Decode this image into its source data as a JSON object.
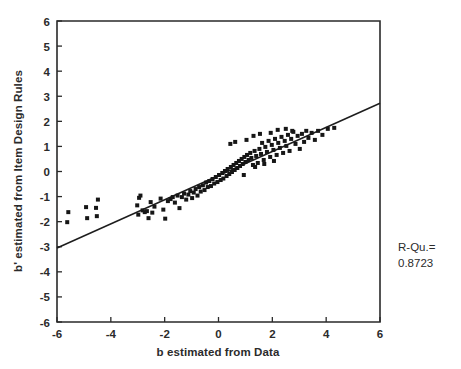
{
  "figure": {
    "background": "#ffffff",
    "ink_color": "#1d1d1d"
  },
  "axes": {
    "x_label": "b estimated from Data",
    "y_label": "b' estimated from Item Design Rules",
    "x_ticks": [
      "-6",
      "-4",
      "-2",
      "0",
      "2",
      "4",
      "6"
    ],
    "y_ticks": [
      "6",
      "5",
      "4",
      "3",
      "2",
      "1",
      "0",
      "-1",
      "-2",
      "-3",
      "-4",
      "-5",
      "-6"
    ]
  },
  "annotations": {
    "r_squared_label": "R-Qu.=",
    "r_squared_value": "0.8723"
  },
  "chart_data": {
    "type": "scatter",
    "title": "",
    "xlabel": "b estimated from Data",
    "ylabel": "b' estimated from Item Design Rules",
    "xlim": [
      -6,
      6
    ],
    "ylim": [
      -6,
      6
    ],
    "xticks": [
      -6,
      -4,
      -2,
      0,
      2,
      4,
      6
    ],
    "yticks": [
      -6,
      -5,
      -4,
      -3,
      -2,
      -1,
      0,
      1,
      2,
      3,
      4,
      5,
      6
    ],
    "grid": false,
    "legend": null,
    "marker": "square",
    "marker_size": 4,
    "annotations": [
      {
        "text": "R-Qu.=",
        "x": 6.9,
        "y": -2.6
      },
      {
        "text": "0.8723",
        "x": 6.9,
        "y": -3.2
      }
    ],
    "fit_line": {
      "type": "linear",
      "x": [
        -6,
        6
      ],
      "y": [
        -3.05,
        2.72
      ],
      "slope": 0.481,
      "intercept": -0.165
    },
    "r_squared": 0.8723,
    "points": [
      [
        -5.62,
        -2.02
      ],
      [
        -5.58,
        -1.62
      ],
      [
        -4.92,
        -1.42
      ],
      [
        -4.88,
        -1.86
      ],
      [
        -4.55,
        -1.45
      ],
      [
        -4.52,
        -1.78
      ],
      [
        -4.48,
        -1.12
      ],
      [
        -3.02,
        -1.35
      ],
      [
        -2.98,
        -1.72
      ],
      [
        -2.95,
        -1.05
      ],
      [
        -2.82,
        -1.55
      ],
      [
        -2.74,
        -1.62
      ],
      [
        -2.66,
        -1.58
      ],
      [
        -2.52,
        -1.22
      ],
      [
        -2.46,
        -1.64
      ],
      [
        -2.38,
        -1.4
      ],
      [
        -2.15,
        -1.08
      ],
      [
        -2.05,
        -1.52
      ],
      [
        -1.98,
        -1.88
      ],
      [
        -1.88,
        -1.18
      ],
      [
        -1.78,
        -1.1
      ],
      [
        -1.7,
        -1.02
      ],
      [
        -1.62,
        -1.24
      ],
      [
        -1.52,
        -0.96
      ],
      [
        -1.45,
        -1.46
      ],
      [
        -1.36,
        -1.02
      ],
      [
        -1.28,
        -0.88
      ],
      [
        -1.2,
        -1.12
      ],
      [
        -1.12,
        -0.92
      ],
      [
        -1.05,
        -0.78
      ],
      [
        -0.98,
        -1.06
      ],
      [
        -0.92,
        -0.84
      ],
      [
        -0.85,
        -0.7
      ],
      [
        -0.78,
        -0.96
      ],
      [
        -0.72,
        -0.62
      ],
      [
        -0.66,
        -0.8
      ],
      [
        -0.58,
        -0.55
      ],
      [
        -0.52,
        -0.74
      ],
      [
        -0.46,
        -0.44
      ],
      [
        -0.4,
        -0.62
      ],
      [
        -0.34,
        -0.38
      ],
      [
        -0.28,
        -0.58
      ],
      [
        -0.22,
        -0.3
      ],
      [
        -0.16,
        -0.48
      ],
      [
        -0.1,
        -0.22
      ],
      [
        -0.04,
        -0.42
      ],
      [
        0.02,
        -0.14
      ],
      [
        0.08,
        -0.34
      ],
      [
        0.14,
        -0.06
      ],
      [
        0.18,
        -0.28
      ],
      [
        0.24,
        0.02
      ],
      [
        0.3,
        -0.18
      ],
      [
        0.34,
        0.1
      ],
      [
        0.4,
        -0.1
      ],
      [
        0.46,
        0.18
      ],
      [
        0.5,
        -0.02
      ],
      [
        0.56,
        0.26
      ],
      [
        0.6,
        0.06
      ],
      [
        0.66,
        0.34
      ],
      [
        0.7,
        0.14
      ],
      [
        0.76,
        0.42
      ],
      [
        0.8,
        0.22
      ],
      [
        0.86,
        0.5
      ],
      [
        0.9,
        0.3
      ],
      [
        0.96,
        0.58
      ],
      [
        1.0,
        0.38
      ],
      [
        1.06,
        0.66
      ],
      [
        1.12,
        0.46
      ],
      [
        1.18,
        0.74
      ],
      [
        1.22,
        0.54
      ],
      [
        1.28,
        0.26
      ],
      [
        1.34,
        0.82
      ],
      [
        1.4,
        0.62
      ],
      [
        1.46,
        0.34
      ],
      [
        1.52,
        0.9
      ],
      [
        1.58,
        0.7
      ],
      [
        1.62,
        1.14
      ],
      [
        1.68,
        0.46
      ],
      [
        1.74,
        0.98
      ],
      [
        1.8,
        0.78
      ],
      [
        1.86,
        1.22
      ],
      [
        1.92,
        0.58
      ],
      [
        1.98,
        1.06
      ],
      [
        2.04,
        0.86
      ],
      [
        2.1,
        1.3
      ],
      [
        2.16,
        0.66
      ],
      [
        2.22,
        1.14
      ],
      [
        2.28,
        0.94
      ],
      [
        2.34,
        1.38
      ],
      [
        2.4,
        0.74
      ],
      [
        2.46,
        1.22
      ],
      [
        2.52,
        1.02
      ],
      [
        2.58,
        1.46
      ],
      [
        2.64,
        0.82
      ],
      [
        2.7,
        1.3
      ],
      [
        2.78,
        1.58
      ],
      [
        2.86,
        1.1
      ],
      [
        2.94,
        1.42
      ],
      [
        3.02,
        0.9
      ],
      [
        3.1,
        1.5
      ],
      [
        3.18,
        1.18
      ],
      [
        3.26,
        1.62
      ],
      [
        3.34,
        1.34
      ],
      [
        3.46,
        1.54
      ],
      [
        3.58,
        1.26
      ],
      [
        3.7,
        1.62
      ],
      [
        3.86,
        1.46
      ],
      [
        4.06,
        1.7
      ],
      [
        4.3,
        1.74
      ],
      [
        0.44,
        1.1
      ],
      [
        0.62,
        1.18
      ],
      [
        1.04,
        1.26
      ],
      [
        1.3,
        1.42
      ],
      [
        1.54,
        1.5
      ],
      [
        1.94,
        1.54
      ],
      [
        2.2,
        1.66
      ],
      [
        2.5,
        1.7
      ],
      [
        2.74,
        1.62
      ],
      [
        -2.9,
        -0.96
      ],
      [
        -2.6,
        -1.86
      ],
      [
        0.94,
        -0.14
      ],
      [
        1.36,
        0.18
      ],
      [
        1.7,
        0.3
      ],
      [
        2.06,
        0.42
      ]
    ]
  }
}
